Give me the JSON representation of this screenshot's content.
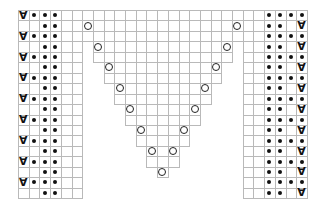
{
  "chart_data": {
    "type": "knitting-chart",
    "grid": {
      "columns": 27,
      "rows": 18,
      "origin_px": [
        18,
        10
      ],
      "cell_w": 10.7,
      "cell_h": 10.45,
      "line_color": "#b9b9b9"
    },
    "legend_symbols": {
      "dot": "purl",
      "slip": "∀",
      "circle": "yarn over",
      "blank": "knit"
    },
    "left_block": {
      "columns": [
        1,
        6
      ],
      "row_patterns": {
        "odd": [
          "slip",
          "dot",
          "dot",
          "dot",
          "blank",
          "blank"
        ],
        "even": [
          "blank",
          "blank",
          "dot",
          "dot",
          "blank",
          "blank"
        ]
      }
    },
    "right_block": {
      "columns": [
        22,
        27
      ],
      "row_patterns": {
        "odd": [
          "blank",
          "blank",
          "dot",
          "dot",
          "dot",
          "dot"
        ],
        "even": [
          "blank",
          "blank",
          "dot",
          "dot",
          "blank",
          "slip"
        ]
      }
    },
    "center_triangle": {
      "row_spans": [
        {
          "rows": [
            1,
            3
          ],
          "cols": [
            7,
            21
          ]
        },
        {
          "rows": [
            4,
            5
          ],
          "cols": [
            8,
            20
          ]
        },
        {
          "rows": [
            6,
            7
          ],
          "cols": [
            9,
            19
          ]
        },
        {
          "rows": [
            8,
            9
          ],
          "cols": [
            10,
            18
          ]
        },
        {
          "rows": [
            10,
            11
          ],
          "cols": [
            11,
            17
          ]
        },
        {
          "rows": [
            12,
            13
          ],
          "cols": [
            12,
            16
          ]
        },
        {
          "rows": [
            14,
            15
          ],
          "cols": [
            13,
            15
          ]
        },
        {
          "rows": [
            16,
            16
          ],
          "cols": [
            14,
            14
          ]
        }
      ],
      "yarn_overs": [
        {
          "row": 2,
          "col": 7
        },
        {
          "row": 2,
          "col": 21
        },
        {
          "row": 4,
          "col": 8
        },
        {
          "row": 4,
          "col": 20
        },
        {
          "row": 6,
          "col": 9
        },
        {
          "row": 6,
          "col": 19
        },
        {
          "row": 8,
          "col": 10
        },
        {
          "row": 8,
          "col": 18
        },
        {
          "row": 10,
          "col": 11
        },
        {
          "row": 10,
          "col": 17
        },
        {
          "row": 12,
          "col": 12
        },
        {
          "row": 12,
          "col": 16
        },
        {
          "row": 14,
          "col": 13
        },
        {
          "row": 14,
          "col": 15
        },
        {
          "row": 16,
          "col": 14
        }
      ]
    }
  }
}
